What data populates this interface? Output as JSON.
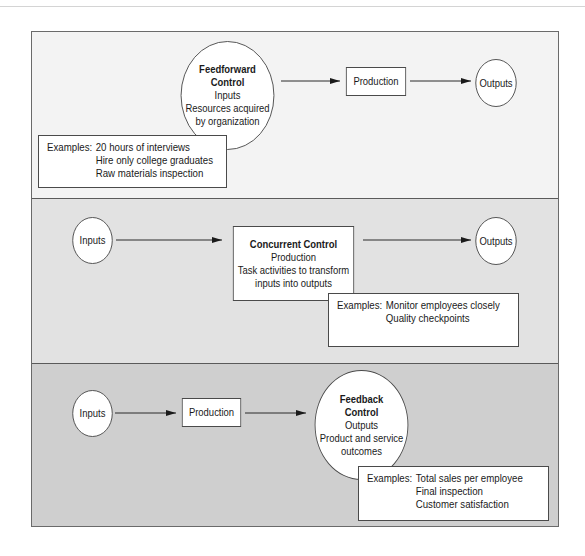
{
  "diagram": {
    "type": "control-process-flow",
    "panels": [
      {
        "id": "feedforward",
        "background": "#f3f3f3",
        "nodes": [
          {
            "id": "ff-control",
            "shape": "circle",
            "title_line1": "Feedforward",
            "title_line2": "Control",
            "line1": "Inputs",
            "line2": "Resources acquired",
            "line3": "by organization"
          },
          {
            "id": "ff-production",
            "shape": "rect",
            "label": "Production"
          },
          {
            "id": "ff-outputs",
            "shape": "circle",
            "label": "Outputs"
          }
        ],
        "edges": [
          [
            "ff-control",
            "ff-production"
          ],
          [
            "ff-production",
            "ff-outputs"
          ]
        ],
        "examples": {
          "label": "Examples:",
          "items": [
            "20 hours of interviews",
            "Hire only college graduates",
            "Raw materials inspection"
          ]
        }
      },
      {
        "id": "concurrent",
        "background": "#e2e2e2",
        "nodes": [
          {
            "id": "cc-inputs",
            "shape": "circle",
            "label": "Inputs"
          },
          {
            "id": "cc-control",
            "shape": "rect",
            "title": "Concurrent Control",
            "line1": "Production",
            "line2": "Task activities to transform",
            "line3": "inputs into outputs"
          },
          {
            "id": "cc-outputs",
            "shape": "circle",
            "label": "Outputs"
          }
        ],
        "edges": [
          [
            "cc-inputs",
            "cc-control"
          ],
          [
            "cc-control",
            "cc-outputs"
          ]
        ],
        "examples": {
          "label": "Examples:",
          "items": [
            "Monitor employees closely",
            "Quality checkpoints"
          ]
        }
      },
      {
        "id": "feedback",
        "background": "#cfcfcf",
        "nodes": [
          {
            "id": "fb-inputs",
            "shape": "circle",
            "label": "Inputs"
          },
          {
            "id": "fb-production",
            "shape": "rect",
            "label": "Production"
          },
          {
            "id": "fb-control",
            "shape": "circle",
            "title_line1": "Feedback",
            "title_line2": "Control",
            "line1": "Outputs",
            "line2": "Product and service",
            "line3": "outcomes"
          }
        ],
        "edges": [
          [
            "fb-inputs",
            "fb-production"
          ],
          [
            "fb-production",
            "fb-control"
          ]
        ],
        "examples": {
          "label": "Examples:",
          "items": [
            "Total sales per employee",
            "Final inspection",
            "Customer satisfaction"
          ]
        }
      }
    ]
  }
}
